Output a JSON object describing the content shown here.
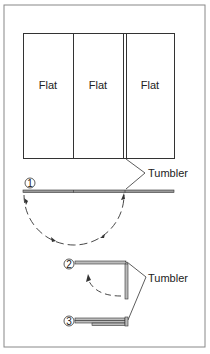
{
  "diagram": {
    "flats": [
      {
        "label": "Flat"
      },
      {
        "label": "Flat"
      },
      {
        "label": "Flat"
      }
    ],
    "callouts": {
      "tumbler_top": "Tumbler",
      "tumbler_bottom": "Tumbler"
    },
    "steps": [
      {
        "number": "1"
      },
      {
        "number": "2"
      },
      {
        "number": "3"
      }
    ],
    "colors": {
      "line": "#333333",
      "frame": "#888888",
      "background": "#ffffff"
    }
  }
}
